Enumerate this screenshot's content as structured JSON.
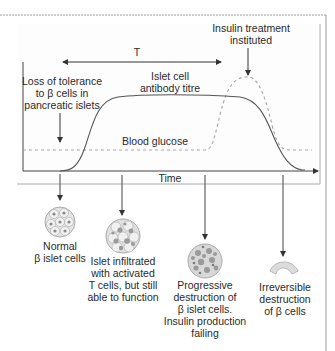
{
  "chart": {
    "period_label": "T",
    "x_axis_label": "Time",
    "annotations": {
      "loss_of_tolerance": [
        "Loss of tolerance",
        "to β cells in",
        "pancreatic islets"
      ],
      "insulin_treatment": [
        "Insulin treatment",
        "instituted"
      ]
    },
    "curves": {
      "antibody": [
        "Islet cell",
        "antibody titre"
      ],
      "glucose": "Blood glucose"
    }
  },
  "stages": [
    {
      "lines": [
        "Normal",
        "β islet cells"
      ],
      "icon": "normal-islet-icon"
    },
    {
      "lines": [
        "Islet infiltrated",
        "with activated",
        "T cells, but still",
        "able to function"
      ],
      "icon": "infiltrated-islet-icon"
    },
    {
      "lines": [
        "Progressive",
        "destruction of",
        "β islet cells.",
        "Insulin production",
        "failing"
      ],
      "icon": "destroyed-islet-icon"
    },
    {
      "lines": [
        "Irreversible",
        "destruction",
        "of β cells"
      ],
      "icon": "destroyed-remnant-icon"
    }
  ],
  "colors": {
    "line": "#555555",
    "frame": "#9a9a9a",
    "dashed": "#aaaaaa",
    "cell_fill": "#d9d9d9",
    "nucleus": "#8a8a8a",
    "remnant": "#dcdcdc"
  }
}
